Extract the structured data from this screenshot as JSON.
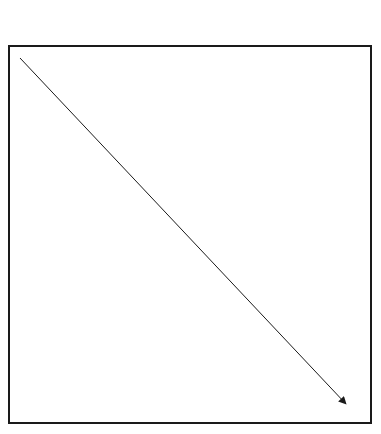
{
  "diagram": {
    "canvas": {
      "width": 381,
      "height": 434,
      "background": "#ffffff"
    },
    "frame": {
      "x": 9,
      "y": 46,
      "width": 362,
      "height": 377,
      "stroke": "#1a1a1a",
      "stroke_width": 2
    },
    "arrow": {
      "x1": 20,
      "y1": 58,
      "x2": 346,
      "y2": 404,
      "stroke": "#1a1a1a",
      "stroke_width": 1,
      "head": "filled-triangle",
      "direction": "top-left-to-bottom-right"
    }
  }
}
